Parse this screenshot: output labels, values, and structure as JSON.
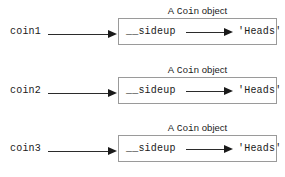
{
  "diagram": {
    "type": "object-reference-diagram",
    "background_color": "#ffffff",
    "line_color": "#1a1a1a",
    "box_border_color": "#9a9a9a",
    "caption": {
      "prefix": "A",
      "class_name": "Coin",
      "suffix": "object"
    },
    "rows": [
      {
        "variable": "coin1",
        "attribute": "__sideup",
        "value": "'Heads'"
      },
      {
        "variable": "coin2",
        "attribute": "__sideup",
        "value": "'Heads'"
      },
      {
        "variable": "coin3",
        "attribute": "__sideup",
        "value": "'Heads'"
      }
    ]
  }
}
